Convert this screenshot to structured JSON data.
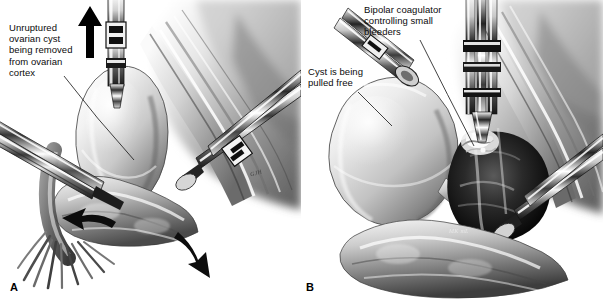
{
  "figure": {
    "background_color": "#ffffff",
    "ink_color": "#000000",
    "width": 603,
    "height": 307,
    "style": "grayscale medical pen-and-ink / airbrush illustration"
  },
  "panels": [
    {
      "id": "A",
      "letter": "A",
      "callouts": [
        {
          "name": "unruptured-cyst-callout",
          "text": "Unruptured\novarian cyst\nbeing removed\nfrom ovarian\ncortex"
        }
      ],
      "annotations": {
        "arrow_up": "traction-arrow-up",
        "arrow_left": "retraction-arrow-left",
        "arrow_right": "retraction-arrow-right"
      },
      "signature": "GJH"
    },
    {
      "id": "B",
      "letter": "B",
      "callouts": [
        {
          "name": "bipolar-coagulator-callout",
          "text": "Bipolar coagulator\ncontrolling small\nbleeders"
        },
        {
          "name": "cyst-pulled-free-callout",
          "text": "Cyst is being\npulled free"
        }
      ],
      "signature": "MK mL"
    }
  ],
  "anatomy": {
    "cyst": "ovarian cyst",
    "cortex": "ovarian cortex",
    "tube": "fallopian tube",
    "fimbriae": "fimbriae",
    "broad_ligament": "broad ligament",
    "bleeding_bed": "cyst bed with small bleeders"
  },
  "instruments": {
    "grasper": "laparoscopic grasping forceps",
    "dissector": "blunt dissecting forceps",
    "bipolar": "bipolar coagulator forceps"
  }
}
